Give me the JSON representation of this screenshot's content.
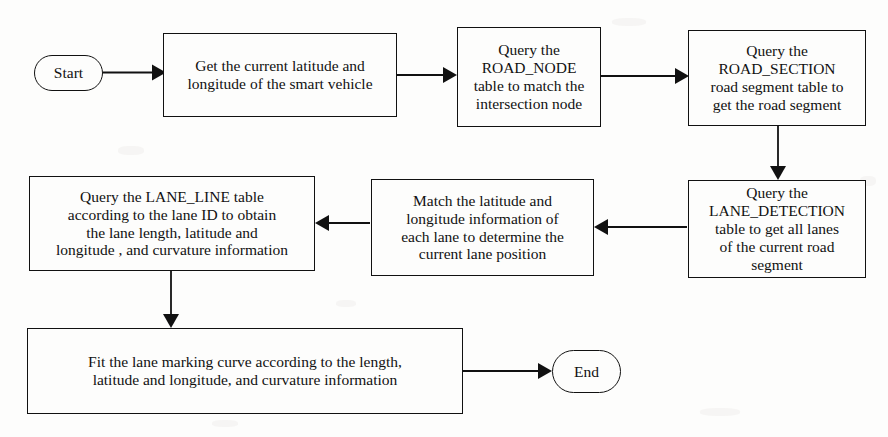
{
  "diagram": {
    "background_color": "#fdfdfc",
    "line_color": "#111111",
    "nodes": [
      {
        "id": "start",
        "name": "start-terminator",
        "shape": "stadium",
        "label": "Start"
      },
      {
        "id": "get_position",
        "name": "process-get-current-position",
        "shape": "rectangle",
        "label": "Get the current latitude and\nlongitude of the smart vehicle"
      },
      {
        "id": "road_node",
        "name": "process-query-road-node",
        "shape": "rectangle",
        "label": "Query the\nROAD_NODE\ntable to match the\nintersection node"
      },
      {
        "id": "road_section",
        "name": "process-query-road-section",
        "shape": "rectangle",
        "label": "Query the\nROAD_SECTION\nroad segment table to\nget the road segment"
      },
      {
        "id": "lane_detection",
        "name": "process-query-lane-detection",
        "shape": "rectangle",
        "label": "Query the\nLANE_DETECTION\ntable to get all lanes\nof the current road\nsegment"
      },
      {
        "id": "match_lane",
        "name": "process-match-lane-position",
        "shape": "rectangle",
        "label": "Match the latitude and\nlongitude information of\neach lane to determine the\ncurrent lane position"
      },
      {
        "id": "lane_line",
        "name": "process-query-lane-line",
        "shape": "rectangle",
        "label": "Query the LANE_LINE table\naccording to the lane ID  to obtain\nthe lane length, latitude and\nlongitude , and curvature information"
      },
      {
        "id": "fit_curve",
        "name": "process-fit-lane-marking-curve",
        "shape": "rectangle",
        "label": "Fit the lane marking curve according to the length,\nlatitude and longitude, and curvature information"
      },
      {
        "id": "end",
        "name": "end-terminator",
        "shape": "stadium",
        "label": "End"
      }
    ],
    "edges": [
      {
        "name": "edge-start-to-get-position",
        "from": "start",
        "to": "get_position",
        "direction": "right"
      },
      {
        "name": "edge-get-position-to-road-node",
        "from": "get_position",
        "to": "road_node",
        "direction": "right"
      },
      {
        "name": "edge-road-node-to-road-section",
        "from": "road_node",
        "to": "road_section",
        "direction": "right"
      },
      {
        "name": "edge-road-section-to-lane-detection",
        "from": "road_section",
        "to": "lane_detection",
        "direction": "down"
      },
      {
        "name": "edge-lane-detection-to-match-lane",
        "from": "lane_detection",
        "to": "match_lane",
        "direction": "left"
      },
      {
        "name": "edge-match-lane-to-lane-line",
        "from": "match_lane",
        "to": "lane_line",
        "direction": "left"
      },
      {
        "name": "edge-lane-line-to-fit-curve",
        "from": "lane_line",
        "to": "fit_curve",
        "direction": "down"
      },
      {
        "name": "edge-fit-curve-to-end",
        "from": "fit_curve",
        "to": "end",
        "direction": "right"
      }
    ]
  }
}
